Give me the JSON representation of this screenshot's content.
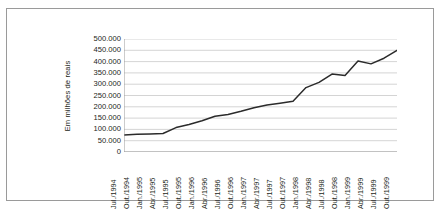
{
  "chart_data": {
    "type": "line",
    "title": "",
    "subtitle": "",
    "xlabel": "",
    "ylabel": "Em milhões de reais",
    "ylim": [
      0,
      500000
    ],
    "ytick_labels": [
      "500.000",
      "450.000",
      "400.000",
      "350.000",
      "300.000",
      "250.000",
      "200.000",
      "150.000",
      "100.000",
      "50.000",
      "0"
    ],
    "ytick_values": [
      500000,
      450000,
      400000,
      350000,
      300000,
      250000,
      200000,
      150000,
      100000,
      50000,
      0
    ],
    "grid": "horizontal",
    "legend": "none",
    "line_color": "#2b2b2b",
    "categories": [
      "Jul./1994",
      "Out./1994",
      "Jan./1995",
      "Abr./1995",
      "Jul./1995",
      "Out./1995",
      "Jan./1996",
      "Abr./1996",
      "Jul./1996",
      "Out./1996",
      "Jan./1997",
      "Abr./1997",
      "Jul./1997",
      "Out./1997",
      "Jan./1998",
      "Abr./1998",
      "Jul./1998",
      "Out./1998",
      "Jan./1999",
      "Abr./1999",
      "Jul./1999",
      "Out./1999"
    ],
    "series": [
      {
        "name": "Em milhões de reais",
        "values": [
          75000,
          78000,
          80000,
          82000,
          108000,
          122000,
          138000,
          158000,
          166000,
          180000,
          196000,
          208000,
          216000,
          225000,
          285000,
          308000,
          345000,
          338000,
          403000,
          390000,
          415000,
          450000
        ]
      }
    ]
  }
}
